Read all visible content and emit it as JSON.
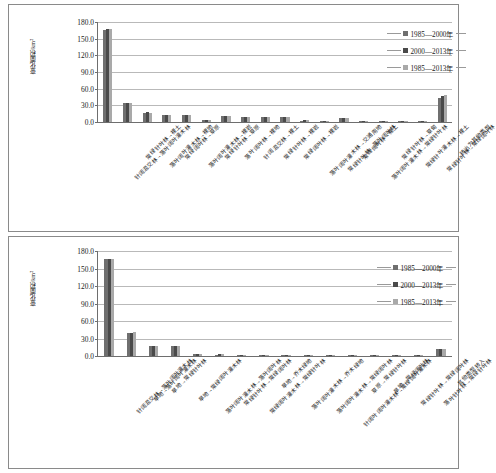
{
  "figure": {
    "background": "#ffffff",
    "series_colors": [
      "#6f6f6f",
      "#4a4a4a",
      "#a9a9a9"
    ]
  },
  "legend": {
    "items": [
      {
        "label": "1985—2000年",
        "color": "#6f6f6f"
      },
      {
        "label": "2000—2013年",
        "color": "#4a4a4a"
      },
      {
        "label": "1985—2013年",
        "color": "#a9a9a9"
      }
    ]
  },
  "axis": {
    "ylabel": "变化面积/km²",
    "yticks": [
      "0.0",
      "30.0",
      "60.0",
      "90.0",
      "120.0",
      "150.0",
      "180.0"
    ]
  },
  "chart_data": [
    {
      "type": "bar",
      "title": "",
      "xlabel": "",
      "ylabel": "变化面积/km²",
      "ylim": [
        0,
        180
      ],
      "ytick_step": 30,
      "grid": true,
      "legend_position": "top-right",
      "categories": [
        "针阔混交林→落叶阔叶灌木林",
        "常绿针叶林→裸土",
        "落叶阔叶灌木林→裸地",
        "常绿阔叶林→草原",
        "落叶阔叶灌木林→裸岩",
        "常绿针叶林→草原",
        "落叶阔叶林→裸地",
        "针阔混交林→裸土",
        "常绿针叶林→裸岩",
        "常绿阔叶林→裸岩",
        "落叶阔叶灌木林→交通用地",
        "常绿针叶林→落叶阔叶林",
        "常绿阔叶林→裸土",
        "落叶阔叶灌木林→常绿针叶林",
        "常绿针叶林→草甸",
        "常绿针叶灌木林→裸土",
        "常绿针叶林→常绿阔叶林",
        "转出为其他类型"
      ],
      "series": [
        {
          "name": "1985—2000年",
          "values": [
            166.5,
            34.2,
            17.0,
            12.5,
            12.0,
            3.0,
            10.5,
            9.5,
            9.0,
            8.5,
            2.5,
            1.5,
            7.0,
            1.5,
            1.0,
            1.0,
            0.5,
            43.0
          ]
        },
        {
          "name": "2000—2013年",
          "values": [
            167.0,
            35.0,
            17.2,
            12.8,
            12.2,
            3.5,
            10.8,
            9.8,
            9.2,
            8.8,
            3.0,
            2.0,
            7.2,
            1.8,
            1.2,
            1.2,
            0.8,
            47.0
          ]
        },
        {
          "name": "1985—2013年",
          "values": [
            166.8,
            34.6,
            17.1,
            12.6,
            12.1,
            3.2,
            10.6,
            9.6,
            9.1,
            8.6,
            2.8,
            1.8,
            7.1,
            1.6,
            1.1,
            1.1,
            0.6,
            49.0
          ]
        }
      ]
    },
    {
      "type": "bar",
      "title": "",
      "xlabel": "",
      "ylabel": "变化面积/km²",
      "ylim": [
        0,
        180
      ],
      "ytick_step": 30,
      "grid": true,
      "legend_position": "top-right",
      "categories": [
        "针阔混交林→落叶阔叶灌木林",
        "旱地→落叶阔叶灌木林",
        "旱地→常绿针叶林",
        "旱地→常绿阔叶灌木林",
        "落叶阔叶灌木林→落叶阔叶林",
        "常绿针叶林→常绿阔叶林",
        "常绿阔叶灌木林→常绿针叶林",
        "旱地→乔木绿地",
        "落叶阔叶灌木林→乔木绿地",
        "落叶阔叶灌木林→常绿阔叶林",
        "针阔叶阔叶灌木林→常绿阔叶灌木林",
        "草原→常绿针叶林",
        "旱地→常绿阔叶林",
        "常绿针叶林→常绿阔叶林",
        "落叶针叶林→常绿针叶林",
        "其他类型转入"
      ],
      "series": [
        {
          "name": "1985—2000年",
          "values": [
            166.5,
            39.0,
            17.0,
            16.5,
            3.0,
            2.5,
            2.0,
            1.0,
            1.5,
            1.2,
            1.0,
            0.8,
            0.8,
            0.6,
            0.5,
            12.0
          ]
        },
        {
          "name": "2000—2013年",
          "values": [
            167.0,
            40.0,
            17.5,
            17.0,
            3.5,
            3.0,
            2.5,
            1.4,
            1.8,
            1.5,
            1.3,
            1.0,
            1.0,
            0.8,
            0.6,
            12.5
          ]
        },
        {
          "name": "1985—2013年",
          "values": [
            166.8,
            40.5,
            17.2,
            16.8,
            3.2,
            2.8,
            2.2,
            1.2,
            1.6,
            1.3,
            1.1,
            0.9,
            0.9,
            0.7,
            0.5,
            12.2
          ]
        }
      ]
    }
  ]
}
